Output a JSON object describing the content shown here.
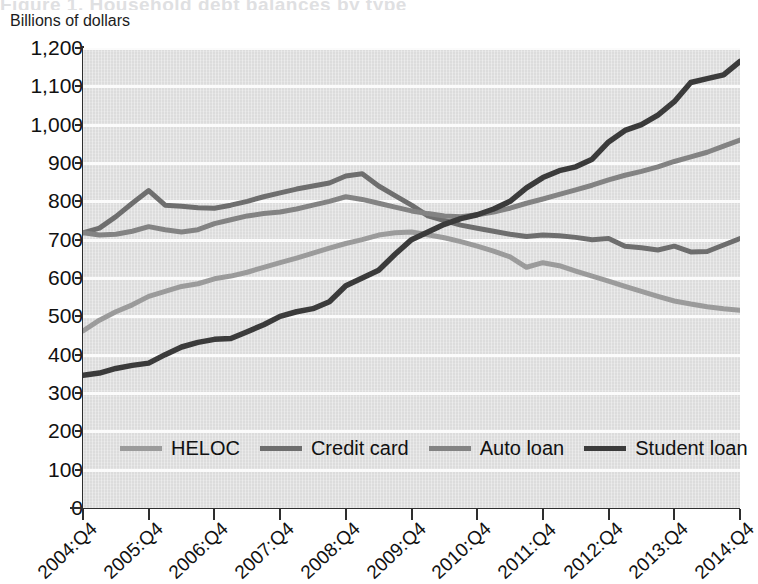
{
  "ghost_title": "Figure 1. Household debt balances by type",
  "axis": {
    "y_unit_label": "Billions of dollars",
    "y_ticks": [
      0,
      100,
      200,
      300,
      400,
      500,
      600,
      700,
      800,
      900,
      1000,
      1100,
      1200
    ],
    "y_tick_labels": [
      "0",
      "100",
      "200",
      "300",
      "400",
      "500",
      "600",
      "700",
      "800",
      "900",
      "1,000",
      "1,100",
      "1,200"
    ],
    "x_tick_labels": [
      "2004:Q4",
      "2005:Q4",
      "2006:Q4",
      "2007:Q4",
      "2008:Q4",
      "2009:Q4",
      "2010:Q4",
      "2011:Q4",
      "2012:Q4",
      "2013:Q4",
      "2014:Q4"
    ]
  },
  "colors": {
    "heloc": "#9b9b9b",
    "credit_card": "#6e6e6e",
    "auto_loan": "#838383",
    "student_loan": "#3b3b3b",
    "plot_background": "#dcdcdc",
    "gridline": "#fbfbfb",
    "axis": "#2e2e2e"
  },
  "legend": {
    "position": "inside-bottom",
    "items": [
      {
        "label": "HELOC",
        "color": "#9b9b9b"
      },
      {
        "label": "Credit card",
        "color": "#6e6e6e"
      },
      {
        "label": "Auto loan",
        "color": "#838383"
      },
      {
        "label": "Student loan",
        "color": "#3b3b3b"
      }
    ]
  },
  "chart_data": {
    "type": "line",
    "title": "",
    "subtitle": "",
    "xlabel": "",
    "ylabel": "Billions of dollars",
    "ylim": [
      0,
      1200
    ],
    "ytick_step": 100,
    "grid": true,
    "legend_position": "inside-bottom",
    "x": [
      "2004:Q4",
      "2005:Q1",
      "2005:Q2",
      "2005:Q3",
      "2005:Q4",
      "2006:Q1",
      "2006:Q2",
      "2006:Q3",
      "2006:Q4",
      "2007:Q1",
      "2007:Q2",
      "2007:Q3",
      "2007:Q4",
      "2008:Q1",
      "2008:Q2",
      "2008:Q3",
      "2008:Q4",
      "2009:Q1",
      "2009:Q2",
      "2009:Q3",
      "2009:Q4",
      "2010:Q1",
      "2010:Q2",
      "2010:Q3",
      "2010:Q4",
      "2011:Q1",
      "2011:Q2",
      "2011:Q3",
      "2011:Q4",
      "2012:Q1",
      "2012:Q2",
      "2012:Q3",
      "2012:Q4",
      "2013:Q1",
      "2013:Q2",
      "2013:Q3",
      "2013:Q4",
      "2014:Q1",
      "2014:Q2",
      "2014:Q3",
      "2014:Q4"
    ],
    "x_major_ticks": [
      "2004:Q4",
      "2005:Q4",
      "2006:Q4",
      "2007:Q4",
      "2008:Q4",
      "2009:Q4",
      "2010:Q4",
      "2011:Q4",
      "2012:Q4",
      "2013:Q4",
      "2014:Q4"
    ],
    "series": [
      {
        "name": "HELOC",
        "color": "#9b9b9b",
        "values": [
          462,
          490,
          512,
          530,
          552,
          565,
          578,
          585,
          598,
          605,
          615,
          628,
          640,
          652,
          665,
          678,
          690,
          700,
          712,
          718,
          720,
          713,
          705,
          695,
          683,
          670,
          655,
          628,
          640,
          632,
          618,
          605,
          592,
          578,
          565,
          552,
          540,
          532,
          525,
          520,
          516
        ],
        "end_value": 516
      },
      {
        "name": "Credit card",
        "color": "#6e6e6e",
        "values": [
          718,
          730,
          760,
          795,
          828,
          790,
          787,
          783,
          782,
          790,
          800,
          812,
          822,
          832,
          840,
          848,
          866,
          872,
          840,
          815,
          790,
          762,
          750,
          738,
          730,
          722,
          714,
          708,
          712,
          710,
          706,
          700,
          703,
          683,
          679,
          673,
          683,
          668,
          669,
          686,
          703
        ],
        "end_value": 703
      },
      {
        "name": "Auto loan",
        "color": "#838383",
        "values": [
          718,
          712,
          714,
          722,
          734,
          726,
          720,
          726,
          742,
          752,
          762,
          768,
          772,
          780,
          790,
          800,
          812,
          805,
          795,
          785,
          775,
          768,
          762,
          760,
          765,
          772,
          782,
          795,
          806,
          818,
          830,
          842,
          856,
          868,
          878,
          890,
          904,
          916,
          928,
          944,
          960
        ],
        "end_value": 960
      },
      {
        "name": "Student loan",
        "color": "#3b3b3b",
        "values": [
          346,
          352,
          364,
          372,
          378,
          400,
          420,
          432,
          440,
          442,
          460,
          478,
          500,
          512,
          520,
          538,
          580,
          600,
          620,
          662,
          700,
          720,
          740,
          755,
          765,
          780,
          800,
          835,
          862,
          880,
          890,
          910,
          955,
          985,
          1000,
          1025,
          1060,
          1110,
          1120,
          1130,
          1165
        ],
        "end_value": 1165
      }
    ]
  }
}
